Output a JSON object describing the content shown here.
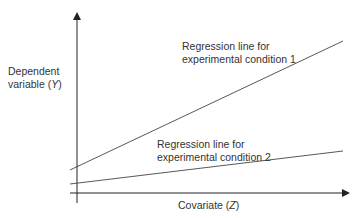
{
  "diagram": {
    "title": "",
    "y_axis": {
      "label_line1": "Dependent",
      "label_line2_prefix": "variable (",
      "label_var": "Y",
      "label_suffix": ")"
    },
    "x_axis": {
      "label_prefix": "Covariate (",
      "label_var": "Z",
      "label_suffix": ")"
    },
    "lines": [
      {
        "name": "condition-1",
        "label_line1": "Regression line for",
        "label_line2": "experimental condition 1",
        "intercept": 0.17,
        "slope": 0.65
      },
      {
        "name": "condition-2",
        "label_line1": "Regression line for",
        "label_line2": "experimental condition 2",
        "intercept": 0.06,
        "slope": 0.18
      }
    ],
    "colors": {
      "axis": "#222222",
      "line": "#444444",
      "text": "#333333"
    }
  }
}
